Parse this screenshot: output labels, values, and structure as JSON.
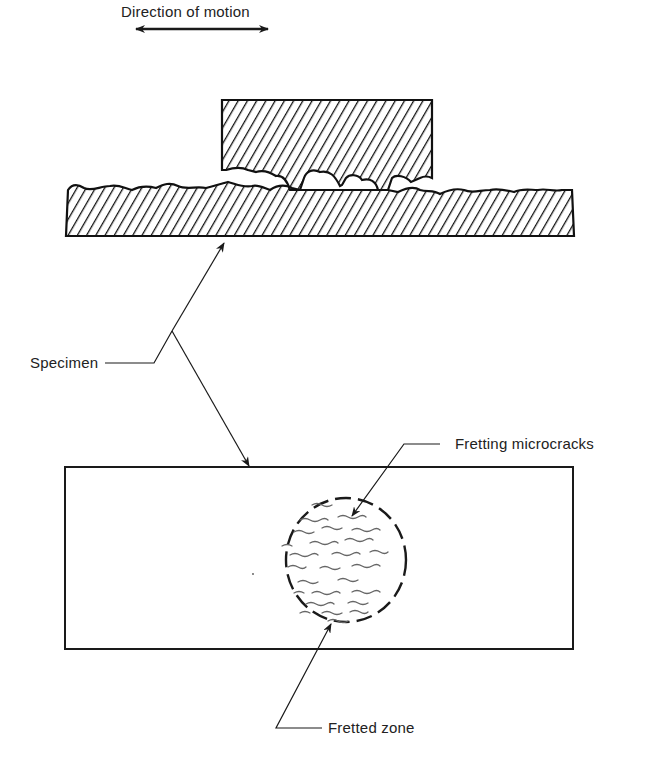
{
  "diagram": {
    "motion_label": "Direction of motion",
    "labels": {
      "specimen": "Specimen",
      "fretting_microcracks": "Fretting microcracks",
      "fretted_zone": "Fretted zone"
    },
    "colors": {
      "ink": "#1a1a1a",
      "crack": "#666666",
      "background": "#ffffff"
    }
  }
}
